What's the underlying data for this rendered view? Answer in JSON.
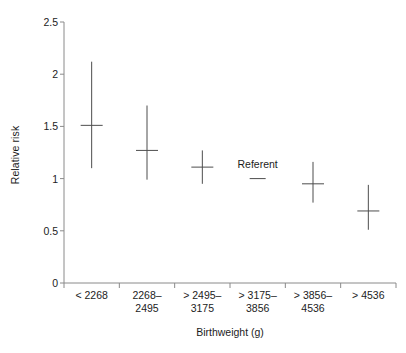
{
  "chart_data": {
    "type": "scatter",
    "title": "",
    "xlabel": "Birthweight (g)",
    "ylabel": "Relative risk",
    "ylim": [
      0,
      2.5
    ],
    "yticks": [
      0,
      0.5,
      1,
      1.5,
      2,
      2.5
    ],
    "ytick_labels": [
      "0",
      "0.5",
      "1",
      "1.5",
      "2",
      "2.5"
    ],
    "grid": false,
    "legend": "none",
    "categories": [
      "< 2268",
      "2268–\n2495",
      "> 2495–\n3175",
      "> 3175–\n3856",
      "> 3856–\n4536",
      "> 4536"
    ],
    "category_labels_flat": [
      "< 2268",
      "2268–2495",
      "> 2495–3175",
      "> 3175–3856",
      "> 3856–4536",
      "> 4536"
    ],
    "series": [
      {
        "name": "Relative risk",
        "marker": "horizontal-tick with vertical 95% CI bar",
        "points": [
          {
            "category": "< 2268",
            "value": 1.51,
            "low": 2.12,
            "high": 1.1,
            "ci_low": 1.1,
            "ci_high": 2.12,
            "referent": false
          },
          {
            "category": "2268–2495",
            "value": 1.27,
            "low": 0.99,
            "high": 1.7,
            "ci_low": 0.99,
            "ci_high": 1.7,
            "referent": false
          },
          {
            "category": "> 2495–3175",
            "value": 1.11,
            "low": 0.95,
            "high": 1.27,
            "ci_low": 0.95,
            "ci_high": 1.27,
            "referent": false
          },
          {
            "category": "> 3175–3856",
            "value": 1.0,
            "low": 1.0,
            "high": 1.0,
            "ci_low": 1.0,
            "ci_high": 1.0,
            "referent": true
          },
          {
            "category": "> 3856–4536",
            "value": 0.95,
            "low": 0.77,
            "high": 1.16,
            "ci_low": 0.77,
            "ci_high": 1.16,
            "referent": false
          },
          {
            "category": "> 4536",
            "value": 0.69,
            "low": 0.51,
            "high": 0.94,
            "ci_low": 0.51,
            "ci_high": 0.94,
            "referent": false
          }
        ]
      }
    ],
    "annotations": [
      {
        "text": "Referent",
        "category": "> 3175–3856",
        "value": 1.06
      }
    ],
    "colors": {
      "axis": "#8a8a8a",
      "marker": "#4d4d4d",
      "text": "#1c1c1c",
      "background": "#ffffff"
    }
  }
}
